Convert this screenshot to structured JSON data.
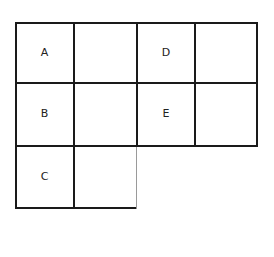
{
  "diagram": {
    "type": "grid",
    "rows": [
      {
        "cells": [
          {
            "label": "A"
          },
          {
            "label": ""
          },
          {
            "label": "D"
          },
          {
            "label": ""
          }
        ]
      },
      {
        "cells": [
          {
            "label": "B"
          },
          {
            "label": ""
          },
          {
            "label": "E"
          },
          {
            "label": ""
          }
        ]
      },
      {
        "cells": [
          {
            "label": "C"
          },
          {
            "label": ""
          }
        ]
      }
    ],
    "line_color": "#1a1a1a",
    "background": "#ffffff"
  }
}
